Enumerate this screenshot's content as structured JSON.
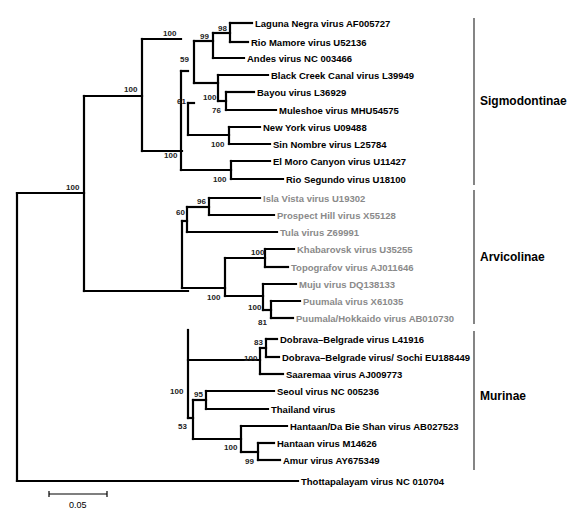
{
  "figure": {
    "type": "phylogenetic-tree",
    "scale_bar": {
      "label": "0.05",
      "x1": 49,
      "x2": 107,
      "y": 494
    },
    "colors": {
      "branch": "#000000",
      "sigmodontinae_text": "#000000",
      "arvicolinae_text": "#8a8a8a",
      "murinae_text": "#000000",
      "outgroup_text": "#000000"
    }
  },
  "tips": [
    {
      "id": "laguna",
      "label": "Laguna Negra virus AF005727",
      "x": 252,
      "y": 23,
      "group": "sigmodontinae"
    },
    {
      "id": "mamore",
      "label": "Rio Mamore virus U52136",
      "x": 248,
      "y": 42,
      "group": "sigmodontinae"
    },
    {
      "id": "andes",
      "label": "Andes virus NC 003466",
      "x": 244,
      "y": 58,
      "group": "sigmodontinae"
    },
    {
      "id": "blackcreek",
      "label": "Black Creek Canal virus L39949",
      "x": 268,
      "y": 75,
      "group": "sigmodontinae"
    },
    {
      "id": "bayou",
      "label": "Bayou virus L36929",
      "x": 254,
      "y": 92,
      "group": "sigmodontinae"
    },
    {
      "id": "muleshoe",
      "label": "Muleshoe virus MHU54575",
      "x": 276,
      "y": 110,
      "group": "sigmodontinae"
    },
    {
      "id": "newyork",
      "label": "New York virus U09488",
      "x": 260,
      "y": 127,
      "group": "sigmodontinae"
    },
    {
      "id": "sinnombre",
      "label": "Sin Nombre virus L25784",
      "x": 270,
      "y": 144,
      "group": "sigmodontinae"
    },
    {
      "id": "elmoro",
      "label": "El Moro Canyon virus U11427",
      "x": 270,
      "y": 161,
      "group": "sigmodontinae"
    },
    {
      "id": "segundo",
      "label": "Rio Segundo virus U18100",
      "x": 283,
      "y": 179,
      "group": "sigmodontinae"
    },
    {
      "id": "islavista",
      "label": "Isla Vista virus U19302",
      "x": 260,
      "y": 198,
      "group": "arvicolinae"
    },
    {
      "id": "prospect",
      "label": "Prospect Hill virus X55128",
      "x": 274,
      "y": 215,
      "group": "arvicolinae"
    },
    {
      "id": "tula",
      "label": "Tula virus Z69991",
      "x": 277,
      "y": 232,
      "group": "arvicolinae"
    },
    {
      "id": "khabarovsk",
      "label": "Khabarovsk virus U35255",
      "x": 294,
      "y": 249,
      "group": "arvicolinae"
    },
    {
      "id": "topografov",
      "label": "Topografov virus AJ011646",
      "x": 288,
      "y": 267,
      "group": "arvicolinae"
    },
    {
      "id": "muju",
      "label": "Muju virus DQ138133",
      "x": 296,
      "y": 284,
      "group": "arvicolinae"
    },
    {
      "id": "puumala",
      "label": "Puumala virus X61035",
      "x": 300,
      "y": 301,
      "group": "arvicolinae"
    },
    {
      "id": "hokkaido",
      "label": "Puumala/Hokkaido virus AB010730",
      "x": 293,
      "y": 318,
      "group": "arvicolinae"
    },
    {
      "id": "dobrava",
      "label": "Dobrava–Belgrade virus L41916",
      "x": 277,
      "y": 339,
      "group": "murinae"
    },
    {
      "id": "sochi",
      "label": "Dobrava–Belgrade virus/ Sochi EU188449",
      "x": 279,
      "y": 357,
      "group": "murinae"
    },
    {
      "id": "saaremaa",
      "label": "Saaremaa virus AJ009773",
      "x": 283,
      "y": 374,
      "group": "murinae"
    },
    {
      "id": "seoul",
      "label": "Seoul virus NC 005236",
      "x": 274,
      "y": 391,
      "group": "murinae"
    },
    {
      "id": "thailand",
      "label": "Thailand virus",
      "x": 268,
      "y": 409,
      "group": "murinae"
    },
    {
      "id": "hantaandbs",
      "label": "Hantaan/Da Bie Shan virus AB027523",
      "x": 287,
      "y": 426,
      "group": "murinae"
    },
    {
      "id": "hantaan",
      "label": "Hantaan virus M14626",
      "x": 274,
      "y": 443,
      "group": "murinae"
    },
    {
      "id": "amur",
      "label": "Amur virus AY675349",
      "x": 280,
      "y": 460,
      "group": "murinae"
    },
    {
      "id": "thottapalayam",
      "label": "Thottapalayam virus NC 010704",
      "x": 298,
      "y": 481,
      "group": "outgroup"
    }
  ],
  "nodes": [
    {
      "id": "root",
      "x": 17,
      "y_top": 193,
      "y_bottom": 481,
      "parent_x": null,
      "support": ""
    },
    {
      "id": "ingroup",
      "x": 84,
      "y_top": 96,
      "y_bottom": 291,
      "parent_x": 17,
      "y": 193,
      "support": "100",
      "sx": 66,
      "sy": 190
    },
    {
      "id": "sigmo_arvi",
      "x": 142,
      "y_top": 39,
      "y_bottom": 151,
      "parent_x": 84,
      "y": 96,
      "support": "100",
      "sx": 124,
      "sy": 92
    },
    {
      "id": "sigmo",
      "x": 181,
      "y_top": 71,
      "y_bottom": 170,
      "parent_x": 142,
      "y": 39,
      "support": "100",
      "sx": 163,
      "sy": 36
    },
    {
      "id": "n61",
      "x": 188,
      "y_top": 103,
      "y_bottom": 135,
      "parent_x": 181,
      "y": 71,
      "support": "61",
      "sx": 177,
      "sy": 104
    },
    {
      "id": "n59",
      "x": 194,
      "y_top": 41,
      "y_bottom": 83,
      "parent_x": 188,
      "y": 103,
      "support": "59",
      "sx": 180,
      "sy": 62
    },
    {
      "id": "n99",
      "x": 213,
      "y_top": 33,
      "y_bottom": 58,
      "parent_x": 194,
      "y": 41,
      "support": "99",
      "sx": 200,
      "sy": 39
    },
    {
      "id": "n98",
      "x": 230,
      "y_top": 23,
      "y_bottom": 42,
      "parent_x": 213,
      "y": 33,
      "support": "98",
      "sx": 218,
      "sy": 31
    },
    {
      "id": "n100bcc",
      "x": 218,
      "y_top": 75,
      "y_bottom": 101,
      "parent_x": 194,
      "y": 83,
      "support": "100",
      "sx": 203,
      "sy": 100
    },
    {
      "id": "n76",
      "x": 226,
      "y_top": 92,
      "y_bottom": 110,
      "parent_x": 218,
      "y": 101,
      "support": "76",
      "sx": 212,
      "sy": 113
    },
    {
      "id": "n100ny",
      "x": 229,
      "y_top": 127,
      "y_bottom": 144,
      "parent_x": 188,
      "y": 135,
      "support": "100",
      "sx": 211,
      "sy": 147
    },
    {
      "id": "n100elm",
      "x": 231,
      "y_top": 161,
      "y_bottom": 179,
      "parent_x": 181,
      "y": 170,
      "support": "100",
      "sx": 213,
      "sy": 182
    },
    {
      "id": "arvi",
      "x": 182,
      "y_top": 221,
      "y_bottom": 288,
      "parent_x": 142,
      "y": 151,
      "support": "100",
      "sx": 164,
      "sy": 158
    },
    {
      "id": "n60",
      "x": 187,
      "y_top": 207,
      "y_bottom": 232,
      "parent_x": 182,
      "y": 221,
      "support": "60",
      "sx": 176,
      "sy": 215
    },
    {
      "id": "n96",
      "x": 209,
      "y_top": 198,
      "y_bottom": 215,
      "parent_x": 187,
      "y": 207,
      "support": "96",
      "sx": 197,
      "sy": 204
    },
    {
      "id": "n100arv",
      "x": 225,
      "y_top": 258,
      "y_bottom": 296,
      "parent_x": 182,
      "y": 288,
      "support": "100",
      "sx": 207,
      "sy": 300
    },
    {
      "id": "n100kh",
      "x": 265,
      "y_top": 249,
      "y_bottom": 267,
      "parent_x": 225,
      "y": 258,
      "support": "100",
      "sx": 251,
      "sy": 255
    },
    {
      "id": "n100mu",
      "x": 263,
      "y_top": 284,
      "y_bottom": 310,
      "parent_x": 225,
      "y": 296,
      "support": "100",
      "sx": 248,
      "sy": 310
    },
    {
      "id": "n81",
      "x": 271,
      "y_top": 301,
      "y_bottom": 318,
      "parent_x": 263,
      "y": 310,
      "support": "81",
      "sx": 258,
      "sy": 325
    },
    {
      "id": "murinae",
      "x": 188,
      "y_top": 360,
      "y_bottom": 418,
      "parent_x": 84,
      "y": 291,
      "support": "",
      "sx": 0,
      "sy": 0
    },
    {
      "id": "n100dob",
      "x": 260,
      "y_top": 348,
      "y_bottom": 374,
      "parent_x": 188,
      "y": 360,
      "support": "100",
      "sx": 244,
      "sy": 361
    },
    {
      "id": "n83",
      "x": 266,
      "y_top": 339,
      "y_bottom": 357,
      "parent_x": 260,
      "y": 348,
      "support": "83",
      "sx": 254,
      "sy": 345
    },
    {
      "id": "n100mur",
      "x": 188,
      "y_top": 330,
      "y_bottom": 418,
      "parent_x": 84,
      "y": 291,
      "support": "100",
      "sx": 170,
      "sy": 394
    },
    {
      "id": "n53",
      "x": 193,
      "y_top": 400,
      "y_bottom": 439,
      "parent_x": 188,
      "y": 418,
      "support": "53",
      "sx": 178,
      "sy": 429
    },
    {
      "id": "n95",
      "x": 206,
      "y_top": 391,
      "y_bottom": 409,
      "parent_x": 193,
      "y": 400,
      "support": "95",
      "sx": 194,
      "sy": 397
    },
    {
      "id": "n100hd",
      "x": 241,
      "y_top": 426,
      "y_bottom": 452,
      "parent_x": 193,
      "y": 439,
      "support": "100",
      "sx": 224,
      "sy": 450
    },
    {
      "id": "n99am",
      "x": 258,
      "y_top": 443,
      "y_bottom": 460,
      "parent_x": 241,
      "y": 452,
      "support": "99",
      "sx": 245,
      "sy": 464
    }
  ],
  "clades": [
    {
      "name": "Sigmodontinae",
      "x": 474,
      "y_top": 18,
      "y_bottom": 185,
      "label_x": 480,
      "label_y": 105
    },
    {
      "name": "Arvicolinae",
      "x": 474,
      "y_top": 190,
      "y_bottom": 324,
      "label_x": 480,
      "label_y": 261
    },
    {
      "name": "Murinae",
      "x": 474,
      "y_top": 331,
      "y_bottom": 470,
      "label_x": 480,
      "label_y": 400
    }
  ]
}
